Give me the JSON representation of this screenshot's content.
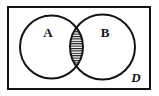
{
  "figure": {
    "type": "venn-diagram",
    "background_color": "#ffffff",
    "stroke_color": "#141414",
    "shaded_region": "intersection",
    "shading_style": "horizontal-hatch",
    "hatch_color": "#141414",
    "hatch_spacing_px": 2.4,
    "universe": {
      "label": "D",
      "shape": "rectangle",
      "x": 8,
      "y": 7,
      "width": 142,
      "height": 82,
      "stroke_width": 2,
      "label_x": 136,
      "label_y": 82
    },
    "sets": [
      {
        "label": "A",
        "cx": 51.5,
        "cy": 47,
        "r": 31.5,
        "label_x": 48,
        "label_y": 37,
        "stroke_width": 2
      },
      {
        "label": "B",
        "cx": 102.5,
        "cy": 47,
        "r": 32.5,
        "label_x": 105,
        "label_y": 37,
        "stroke_width": 2
      }
    ],
    "intersection": {
      "name": "A-intersect-B",
      "top_point": {
        "x": 77,
        "y": 23
      },
      "bottom_point": {
        "x": 77,
        "y": 71
      },
      "shaded": true
    }
  }
}
